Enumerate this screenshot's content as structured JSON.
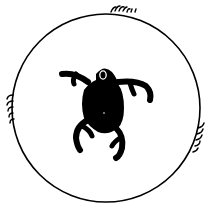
{
  "figure": {
    "colors": {
      "background": "#ffffff",
      "ink": "#000000",
      "eye": "#ffffff"
    },
    "circle": {
      "cx": 106,
      "cy": 108,
      "r": 94
    },
    "creature": {
      "legs": 6,
      "eye_count": 1
    },
    "hair_clusters": [
      "top",
      "left",
      "right"
    ]
  }
}
